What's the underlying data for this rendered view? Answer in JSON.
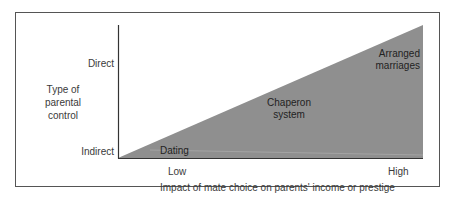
{
  "diagram": {
    "y_axis": {
      "label": "Type of parental control",
      "ticks": {
        "top": "Direct",
        "bottom": "Indirect"
      }
    },
    "x_axis": {
      "label": "Impact of mate choice on parents' income or prestige",
      "ticks": {
        "left": "Low",
        "right": "High"
      }
    },
    "regions": {
      "low": "Dating",
      "mid_line1": "Chaperon",
      "mid_line2": "system",
      "high_line1": "Arranged",
      "high_line2": "marriages"
    },
    "colors": {
      "fill": "#8f8f8f",
      "axis": "#333333",
      "frame": "#555555"
    }
  }
}
